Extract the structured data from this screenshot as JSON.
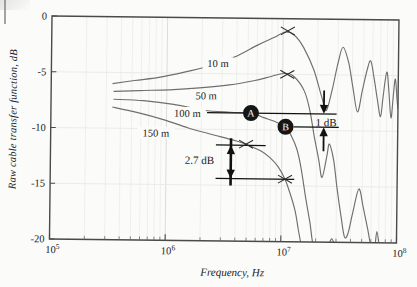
{
  "figure": {
    "kind": "scanned line chart",
    "curve_color": "#6f6f6f",
    "annotation_color": "#111111",
    "grid_color": "#e9e9e7",
    "decade_grid_color": "#dbdbd8",
    "border_color": "#4a4a4a"
  },
  "chart_data": {
    "type": "line",
    "title": "",
    "xlabel": "Frequency, Hz",
    "ylabel": "Raw cable transfer function, dB",
    "x_scale": "log10",
    "xlim_exp": [
      5,
      8
    ],
    "ylim": [
      -20,
      0
    ],
    "grid": {
      "vertical_minor": true,
      "horizontal_major": true,
      "legend": "none"
    },
    "y_ticks": [
      {
        "label": "0",
        "value": 0
      },
      {
        "label": "-5",
        "value": -5
      },
      {
        "label": "-10",
        "value": -10
      },
      {
        "label": "-15",
        "value": -15
      },
      {
        "label": "-20",
        "value": -20
      }
    ],
    "x_ticks": [
      {
        "mantissa": "10",
        "exp": "5"
      },
      {
        "mantissa": "10",
        "exp": "6"
      },
      {
        "mantissa": "10",
        "exp": "7"
      },
      {
        "mantissa": "10",
        "exp": "8"
      }
    ],
    "series": [
      {
        "name": "10 m",
        "label_at": {
          "logf": 6.44,
          "db": -4.1
        },
        "points": [
          [
            5.53,
            -6.0
          ],
          [
            5.72,
            -5.7
          ],
          [
            5.93,
            -5.4
          ],
          [
            6.15,
            -4.9
          ],
          [
            6.37,
            -4.3
          ],
          [
            6.58,
            -3.5
          ],
          [
            6.78,
            -2.4
          ],
          [
            6.92,
            -1.7
          ],
          [
            7.02,
            -1.2
          ],
          [
            7.1,
            -1.5
          ],
          [
            7.18,
            -2.6
          ],
          [
            7.27,
            -4.6
          ],
          [
            7.34,
            -7.0
          ],
          [
            7.38,
            -8.2
          ],
          [
            7.43,
            -6.3
          ],
          [
            7.48,
            -3.8
          ],
          [
            7.52,
            -2.5
          ],
          [
            7.57,
            -3.9
          ],
          [
            7.61,
            -6.2
          ],
          [
            7.65,
            -8.3
          ],
          [
            7.69,
            -6.4
          ],
          [
            7.73,
            -4.5
          ],
          [
            7.76,
            -3.7
          ],
          [
            7.79,
            -5.2
          ],
          [
            7.82,
            -7.1
          ],
          [
            7.85,
            -8.7
          ],
          [
            7.87,
            -6.9
          ],
          [
            7.9,
            -4.7
          ],
          [
            7.92,
            -6.4
          ],
          [
            7.94,
            -8.8
          ],
          [
            7.96,
            -6.6
          ],
          [
            7.975,
            -5.3
          ],
          [
            7.99,
            -7.0
          ],
          [
            8.0,
            -8.0
          ]
        ]
      },
      {
        "name": "50 m",
        "label_at": {
          "logf": 6.34,
          "db": -7.0
        },
        "points": [
          [
            5.54,
            -6.7
          ],
          [
            5.76,
            -6.6
          ],
          [
            6.02,
            -6.5
          ],
          [
            6.28,
            -6.3
          ],
          [
            6.54,
            -6.0
          ],
          [
            6.75,
            -5.6
          ],
          [
            6.9,
            -5.2
          ],
          [
            7.02,
            -4.9
          ],
          [
            7.1,
            -5.2
          ],
          [
            7.19,
            -6.5
          ],
          [
            7.24,
            -8.3
          ],
          [
            7.28,
            -10.6
          ],
          [
            7.32,
            -12.6
          ],
          [
            7.35,
            -14.2
          ],
          [
            7.39,
            -12.3
          ],
          [
            7.41,
            -11.2
          ],
          [
            7.45,
            -12.7
          ],
          [
            7.48,
            -15.1
          ],
          [
            7.52,
            -17.8
          ],
          [
            7.55,
            -19.5
          ],
          [
            7.58,
            -19.2
          ],
          [
            7.62,
            -17.3
          ],
          [
            7.67,
            -15.2
          ],
          [
            7.71,
            -16.9
          ],
          [
            7.75,
            -18.8
          ],
          [
            7.78,
            -20.3
          ],
          [
            7.81,
            -20.6
          ],
          [
            7.83,
            -19.0
          ],
          [
            7.855,
            -20.6
          ],
          [
            7.88,
            -21.2
          ]
        ]
      },
      {
        "name": "100 m",
        "label_at": {
          "logf": 6.18,
          "db": -8.6
        },
        "points": [
          [
            5.54,
            -7.4
          ],
          [
            5.8,
            -7.5
          ],
          [
            6.06,
            -7.8
          ],
          [
            6.32,
            -8.3
          ],
          [
            6.55,
            -8.45
          ],
          [
            6.73,
            -8.5
          ],
          [
            6.84,
            -8.9
          ],
          [
            6.95,
            -9.3
          ],
          [
            7.03,
            -9.7
          ],
          [
            7.08,
            -10.5
          ],
          [
            7.13,
            -11.7
          ],
          [
            7.17,
            -13.5
          ],
          [
            7.21,
            -16.0
          ],
          [
            7.25,
            -18.3
          ],
          [
            7.28,
            -20.3
          ],
          [
            7.33,
            -21.5
          ],
          [
            7.4,
            -20.6
          ],
          [
            7.44,
            -19.7
          ],
          [
            7.475,
            -20.6
          ],
          [
            7.52,
            -21.5
          ]
        ]
      },
      {
        "name": "150 m",
        "label_at": {
          "logf": 5.91,
          "db": -10.4
        },
        "points": [
          [
            5.53,
            -8.1
          ],
          [
            5.76,
            -8.6
          ],
          [
            5.98,
            -9.2
          ],
          [
            6.19,
            -9.9
          ],
          [
            6.41,
            -10.5
          ],
          [
            6.6,
            -11.0
          ],
          [
            6.69,
            -11.3
          ],
          [
            6.82,
            -11.9
          ],
          [
            6.9,
            -12.5
          ],
          [
            6.97,
            -13.3
          ],
          [
            7.03,
            -14.4
          ],
          [
            7.07,
            -15.5
          ],
          [
            7.12,
            -17.2
          ],
          [
            7.15,
            -18.9
          ],
          [
            7.18,
            -20.5
          ]
        ]
      }
    ],
    "x_markers": [
      {
        "logf": 7.04,
        "db": -1.1,
        "on": "10 m"
      },
      {
        "logf": 7.04,
        "db": -5.0,
        "on": "50 m"
      },
      {
        "logf": 6.69,
        "db": -11.3,
        "on": "150 m"
      },
      {
        "logf": 7.03,
        "db": -14.4,
        "on": "150 m"
      }
    ],
    "point_labels": [
      {
        "text": "A",
        "logf": 6.73,
        "db": -8.5
      },
      {
        "text": "B",
        "logf": 7.03,
        "db": -9.7
      }
    ],
    "measurements": [
      {
        "text": "1 dB",
        "text_at": {
          "logf": 7.38,
          "db": -9.3
        },
        "lines": [
          {
            "db": -8.5,
            "from": 6.35,
            "to": 7.47
          },
          {
            "db": -9.7,
            "from": 7.1,
            "to": 7.49
          }
        ],
        "arrows": [
          {
            "logf": 7.36,
            "tail_db": -6.4,
            "tip_db": -8.5,
            "dir": "down"
          },
          {
            "logf": 7.36,
            "tail_db": -11.85,
            "tip_db": -9.7,
            "dir": "up"
          }
        ]
      },
      {
        "text": "2.7 dB",
        "text_at": {
          "logf": 6.29,
          "db": -12.8
        },
        "lines": [
          {
            "db": -11.4,
            "from": 6.43,
            "to": 6.86
          },
          {
            "db": -14.4,
            "from": 6.43,
            "to": 7.11
          }
        ],
        "arrows": [
          {
            "logf": 6.56,
            "tail_db": -11.4,
            "tip_db": -14.4,
            "dir": "both"
          }
        ]
      }
    ]
  }
}
